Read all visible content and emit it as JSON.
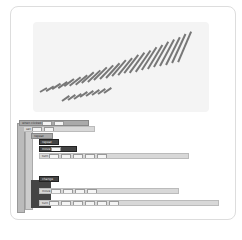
{
  "stage": {
    "description": "rendered pattern of slanted strokes",
    "stroke_color": "#777777",
    "background": "#f4f4f4"
  },
  "code": {
    "blocks": [
      {
        "label": "when clicked",
        "x": 2,
        "y": 0,
        "w": 70,
        "kind": "mid"
      },
      {
        "label": "set",
        "x": 6,
        "y": 6,
        "w": 72,
        "kind": "light"
      },
      {
        "label": "repeat",
        "x": 14,
        "y": 13,
        "w": 22,
        "kind": "mid"
      },
      {
        "label": "repeat",
        "x": 22,
        "y": 19,
        "w": 20,
        "kind": "dark"
      },
      {
        "label": "move",
        "x": 22,
        "y": 26,
        "w": 38,
        "kind": "dark"
      },
      {
        "label": "turn",
        "x": 22,
        "y": 33,
        "w": 150,
        "kind": "light"
      },
      {
        "label": "change",
        "x": 22,
        "y": 56,
        "w": 20,
        "kind": "dark"
      },
      {
        "label": "move",
        "x": 22,
        "y": 68,
        "w": 140,
        "kind": "light"
      },
      {
        "label": "turn",
        "x": 22,
        "y": 80,
        "w": 180,
        "kind": "light"
      }
    ]
  }
}
